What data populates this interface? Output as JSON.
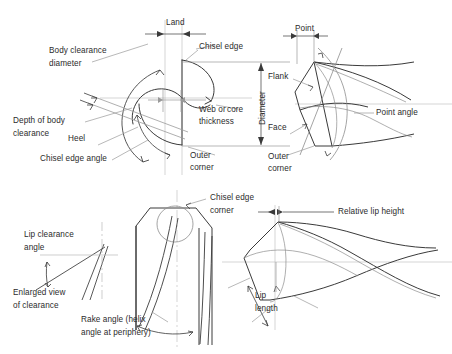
{
  "figure": {
    "type": "technical-line-diagram",
    "background_color": "#ffffff",
    "line_color": "#3a3a3a",
    "thin_line_color": "#9a9a9a",
    "text_color": "#2b2b2b",
    "width": 452,
    "height": 354
  },
  "views": {
    "top_left": {
      "name": "drill-cross-section-view",
      "labels": {
        "body_clearance_diameter": "Body clearance\ndiameter",
        "depth_of_body_clearance": "Depth of body\nclearance",
        "heel": "Heel",
        "chisel_edge_angle": "Chisel edge angle",
        "land": "Land",
        "chisel_edge": "Chisel edge",
        "web_or_core_thickness": "Web or core\nthickness",
        "outer_corner": "Outer\ncorner",
        "diameter": "Diameter"
      }
    },
    "top_right": {
      "name": "drill-point-side-view",
      "labels": {
        "point": "Point",
        "flank": "Flank",
        "face": "Face",
        "point_angle": "Point angle",
        "outer_corner": "Outer\ncorner"
      }
    },
    "bottom_left": {
      "name": "drill-body-and-clearance-view",
      "labels": {
        "lip_clearance_angle": "Lip clearance\nangle",
        "enlarged_view_of_clearance": "Enlarged view\nof clearance",
        "chisel_edge_corner": "Chisel edge\ncorner",
        "rake_angle": "Rake angle (helix\nangle at periphery)"
      }
    },
    "bottom_right": {
      "name": "drill-lip-view",
      "labels": {
        "relative_lip_height": "Relative lip height",
        "lip_length": "Lip\nlength",
        "lip": "Lip"
      }
    }
  },
  "text_labels": [
    {
      "id": "land",
      "text": "Land"
    },
    {
      "id": "body-clearance-diameter-l1",
      "text": "Body clearance"
    },
    {
      "id": "body-clearance-diameter-l2",
      "text": "diameter"
    },
    {
      "id": "chisel-edge",
      "text": "Chisel edge"
    },
    {
      "id": "point",
      "text": "Point"
    },
    {
      "id": "flank",
      "text": "Flank"
    },
    {
      "id": "diameter",
      "text": "Diameter"
    },
    {
      "id": "web-or-core-l1",
      "text": "Web or"
    },
    {
      "id": "web-or-core-l2",
      "text": "core"
    },
    {
      "id": "web-or-core-l3",
      "text": "thickness"
    },
    {
      "id": "depth-of-body-clearance-l1",
      "text": "Depth of body"
    },
    {
      "id": "depth-of-body-clearance-l2",
      "text": "clearance"
    },
    {
      "id": "heel",
      "text": "Heel"
    },
    {
      "id": "face",
      "text": "Face"
    },
    {
      "id": "point-angle",
      "text": "Point angle"
    },
    {
      "id": "chisel-edge-angle",
      "text": "Chisel edge angle"
    },
    {
      "id": "outer-corner-left-l1",
      "text": "Outer"
    },
    {
      "id": "outer-corner-left-l2",
      "text": "corner"
    },
    {
      "id": "outer-corner-right-l1",
      "text": "Outer"
    },
    {
      "id": "outer-corner-right-l2",
      "text": "corner"
    },
    {
      "id": "lip-clearance-angle-l1",
      "text": "Lip clearance"
    },
    {
      "id": "lip-clearance-angle-l2",
      "text": "angle"
    },
    {
      "id": "chisel-edge-corner-l1",
      "text": "Chisel edge"
    },
    {
      "id": "chisel-edge-corner-l2",
      "text": "corner"
    },
    {
      "id": "relative-lip-height",
      "text": "Relative lip height"
    },
    {
      "id": "enlarged-view-l1",
      "text": "Enlarged view"
    },
    {
      "id": "enlarged-view-l2",
      "text": "of clearance"
    },
    {
      "id": "rake-angle-l1",
      "text": "Rake angle (helix"
    },
    {
      "id": "rake-angle-l2",
      "text": "angle at periphery)"
    },
    {
      "id": "lip-length-l1",
      "text": "Lip"
    },
    {
      "id": "lip-length-l2",
      "text": "length"
    },
    {
      "id": "lip",
      "text": "Lip"
    }
  ]
}
